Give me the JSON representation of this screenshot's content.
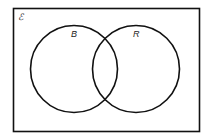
{
  "diagram": {
    "type": "venn",
    "universal_set_label": "ℰ",
    "sets": [
      {
        "label": "B"
      },
      {
        "label": "R"
      }
    ]
  }
}
